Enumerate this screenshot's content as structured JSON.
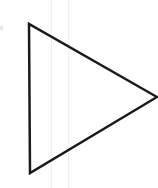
{
  "diagram": {
    "shape": "triangle",
    "orientation": "pointing-right",
    "vertices": [
      [
        29,
        24
      ],
      [
        30,
        173
      ],
      [
        157,
        97
      ]
    ],
    "stroke_color": "#1a1a1a",
    "stroke_width": 2.5,
    "fill": "#ffffff",
    "guides_x": [
      51,
      68
    ],
    "guide_color": "#f0f0f0"
  }
}
